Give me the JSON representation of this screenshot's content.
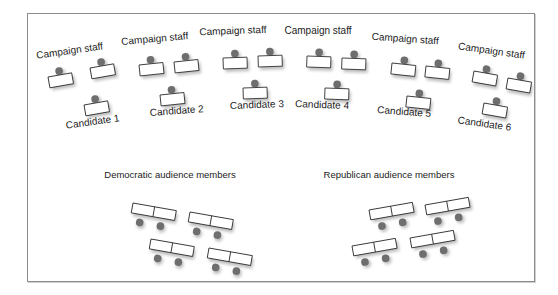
{
  "diagram": {
    "colors": {
      "border": "#8c8c8c",
      "person": "#6e6e6e",
      "desk_fill": "#ffffff",
      "desk_stroke": "#333333",
      "shadow": "#bdbdbd",
      "text": "#222222"
    },
    "stage_groups": [
      {
        "staff_label": "Campaign staff",
        "candidate_label": "Candidate 1",
        "staff_label_pos": [
          70,
          54,
          -8
        ],
        "staff_desks": [
          [
            48,
            77,
            -10
          ],
          [
            90,
            68,
            -10
          ]
        ],
        "candidate_desk": [
          84,
          105,
          -10
        ],
        "candidate_label_pos": [
          93,
          125,
          -8
        ]
      },
      {
        "staff_label": "Campaign staff",
        "candidate_label": "Candidate 2",
        "staff_label_pos": [
          155,
          42,
          -5
        ],
        "staff_desks": [
          [
            139,
            65,
            -6
          ],
          [
            174,
            62,
            -6
          ]
        ],
        "candidate_desk": [
          160,
          95,
          -6
        ],
        "candidate_label_pos": [
          177,
          114,
          -4
        ]
      },
      {
        "staff_label": "Campaign staff",
        "candidate_label": "Candidate 3",
        "staff_label_pos": [
          233,
          34,
          -2
        ],
        "staff_desks": [
          [
            223,
            58,
            -2
          ],
          [
            258,
            56,
            -2
          ]
        ],
        "candidate_desk": [
          243,
          88,
          -2
        ],
        "candidate_label_pos": [
          257,
          108,
          -2
        ]
      },
      {
        "staff_label": "Campaign staff",
        "candidate_label": "Candidate 4",
        "staff_label_pos": [
          318,
          34,
          0
        ],
        "staff_desks": [
          [
            307,
            56,
            2
          ],
          [
            342,
            58,
            2
          ]
        ],
        "candidate_desk": [
          325,
          88,
          2
        ],
        "candidate_label_pos": [
          322,
          108,
          2
        ]
      },
      {
        "staff_label": "Campaign staff",
        "candidate_label": "Candidate 5",
        "staff_label_pos": [
          405,
          42,
          4
        ],
        "staff_desks": [
          [
            392,
            63,
            6
          ],
          [
            426,
            66,
            6
          ]
        ],
        "candidate_desk": [
          407,
          96,
          6
        ],
        "candidate_label_pos": [
          404,
          115,
          4
        ]
      },
      {
        "staff_label": "Campaign staff",
        "candidate_label": "Candidate 6",
        "staff_label_pos": [
          491,
          54,
          8
        ],
        "staff_desks": [
          [
            474,
            71,
            10
          ],
          [
            508,
            78,
            10
          ]
        ],
        "candidate_desk": [
          484,
          103,
          10
        ],
        "candidate_label_pos": [
          484,
          127,
          8
        ]
      }
    ],
    "audience_sections": [
      {
        "label": "Democratic audience members",
        "label_pos": [
          170,
          178
        ],
        "rows": [
          [
            133,
            203,
            10
          ],
          [
            190,
            212,
            10
          ],
          [
            151,
            239,
            10
          ],
          [
            209,
            248,
            10
          ]
        ]
      },
      {
        "label": "Republican audience members",
        "label_pos": [
          389,
          178
        ],
        "rows": [
          [
            369,
            210,
            -10
          ],
          [
            425,
            205,
            -10
          ],
          [
            352,
            246,
            -10
          ],
          [
            410,
            238,
            -10
          ]
        ]
      }
    ]
  }
}
